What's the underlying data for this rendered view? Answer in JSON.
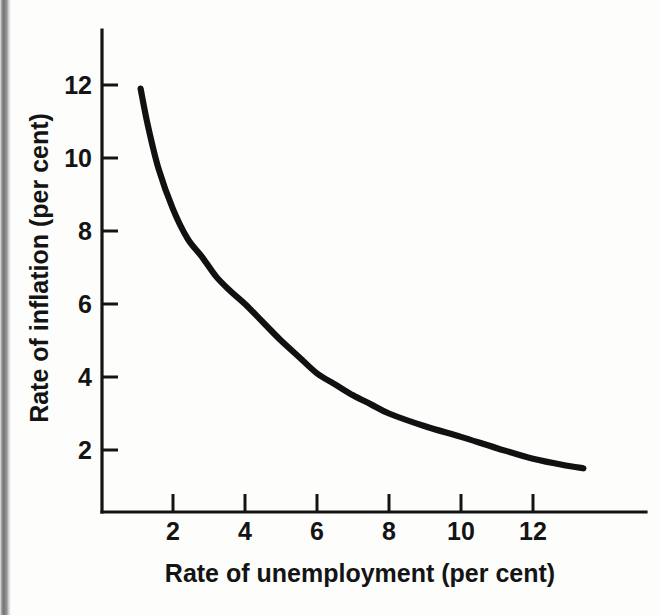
{
  "chart_data": {
    "type": "line",
    "title": "",
    "subtitle": "",
    "xlabel": "Rate of unemployment (per cent)",
    "ylabel": "Rate of inflation (per cent)",
    "xlim": [
      0,
      14.8
    ],
    "ylim": [
      0,
      14.0
    ],
    "xticks": [
      2,
      4,
      6,
      8,
      10,
      12
    ],
    "yticks": [
      2,
      4,
      6,
      8,
      10,
      12
    ],
    "xtick_labels": [
      "2",
      "4",
      "6",
      "8",
      "10",
      "12"
    ],
    "ytick_labels": [
      "2",
      "4",
      "6",
      "8",
      "10",
      "12"
    ],
    "grid": false,
    "legend": null,
    "annotations": [],
    "series": [
      {
        "name": "Phillips curve",
        "color": "#111111",
        "x": [
          1.1,
          1.3,
          1.6,
          2.0,
          2.4,
          2.8,
          3.2,
          3.6,
          4.0,
          4.5,
          5.0,
          5.5,
          6.0,
          6.5,
          7.0,
          7.5,
          8.0,
          9.0,
          10.0,
          11.0,
          12.0,
          13.0,
          13.4
        ],
        "y": [
          11.9,
          10.9,
          9.7,
          8.6,
          7.8,
          7.3,
          6.75,
          6.35,
          6.0,
          5.5,
          5.0,
          4.55,
          4.1,
          3.8,
          3.5,
          3.25,
          3.0,
          2.65,
          2.36,
          2.05,
          1.76,
          1.56,
          1.5
        ]
      }
    ]
  },
  "axes": {
    "x_title": "Rate of unemployment (per cent)",
    "y_title": "Rate of inflation (per cent)",
    "x_tick_labels": [
      "2",
      "4",
      "6",
      "8",
      "10",
      "12"
    ],
    "y_tick_labels": [
      "2",
      "4",
      "6",
      "8",
      "10",
      "12"
    ]
  },
  "colors": {
    "curve": "#111111",
    "axis": "#141414",
    "page_background": "#fdfdfc",
    "gutter_shadow": "#757575"
  }
}
